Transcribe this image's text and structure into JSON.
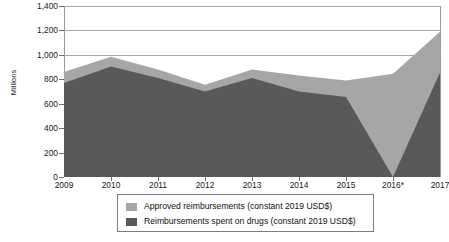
{
  "chart_data": {
    "type": "area",
    "title": "",
    "subtitle": "",
    "xlabel": "",
    "ylabel": "Millions",
    "categories": [
      "2009",
      "2010",
      "2011",
      "2012",
      "2013",
      "2014",
      "2015",
      "2016*",
      "2017"
    ],
    "x": [
      2009,
      2010,
      2011,
      2012,
      2013,
      2014,
      2015,
      2016,
      2017
    ],
    "series": [
      {
        "name": "Approved reimbursements (constant 2019 USD$)",
        "color": "#a6a6a6",
        "values": [
          860,
          985,
          880,
          755,
          880,
          830,
          790,
          845,
          1190
        ]
      },
      {
        "name": "Reimbursements spent on drugs (constant 2019 USD$)",
        "color": "#595959",
        "values": [
          770,
          905,
          810,
          700,
          810,
          700,
          655,
          0,
          855
        ]
      }
    ],
    "ylim": [
      0,
      1400
    ],
    "yticks": [
      0,
      200,
      400,
      600,
      800,
      1000,
      1200,
      1400
    ],
    "ytick_labels": [
      "0",
      "200",
      "400",
      "600",
      "800",
      "1,000",
      "1,200",
      "1,400"
    ],
    "grid": true,
    "gridlines_visible_above": 800,
    "legend_position": "bottom",
    "footnote": "2016*"
  },
  "legend": {
    "items": [
      {
        "label": "Approved reimbursements (constant 2019 USD$)",
        "color": "#a6a6a6",
        "swatch_name": "legend-swatch-approved"
      },
      {
        "label": "Reimbursements spent on drugs (constant 2019 USD$)",
        "color": "#595959",
        "swatch_name": "legend-swatch-spent"
      }
    ]
  },
  "axis": {
    "y_title": "Millions"
  },
  "colors": {
    "series_light": "#a6a6a6",
    "series_dark": "#595959",
    "gridline": "#a6a6a6",
    "frame": "#9b9b9b",
    "text": "#111111",
    "background": "#ffffff"
  }
}
